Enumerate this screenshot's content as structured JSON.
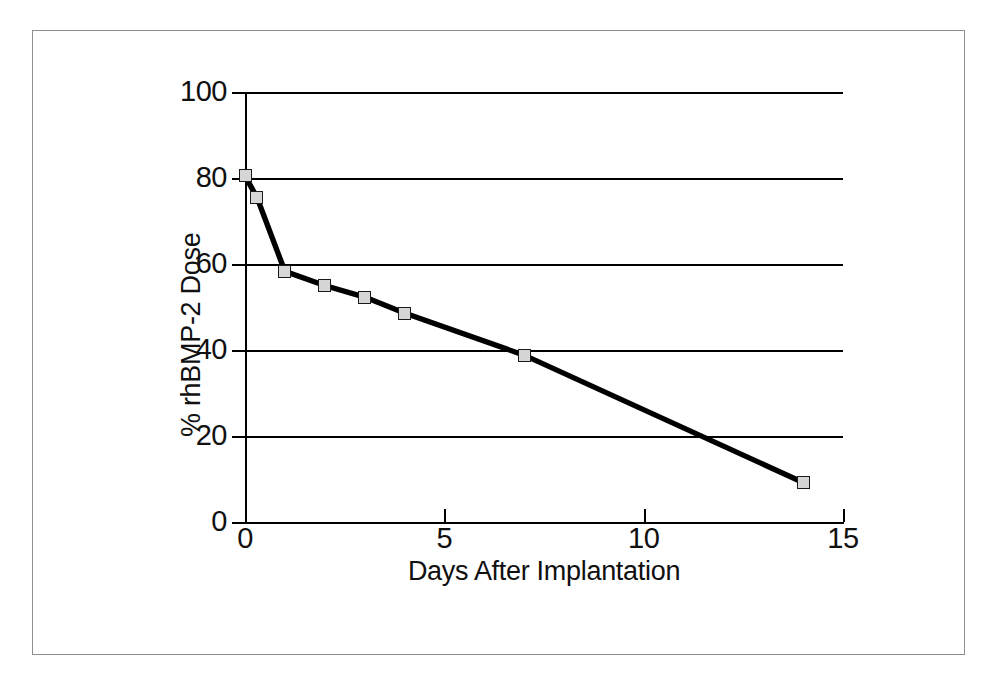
{
  "figure": {
    "background_color": "#ffffff",
    "frame_color": "#8e8e8e",
    "line_color": "#000000",
    "marker_fill": "#d6d6d6",
    "marker_edge": "#1a1a1a"
  },
  "chart_data": {
    "type": "line",
    "title": "",
    "xlabel": "Days After Implantation",
    "ylabel": "% rhBMP-2 Dose",
    "xlim": [
      0,
      15
    ],
    "ylim": [
      0,
      100
    ],
    "xticks": [
      0,
      5,
      10,
      15
    ],
    "xticklabels": [
      "0",
      "5",
      "10",
      "15"
    ],
    "yticks": [
      0,
      20,
      40,
      60,
      80,
      100
    ],
    "yticklabels": [
      "0",
      "20",
      "40",
      "60",
      "80",
      "100"
    ],
    "grid": "horizontal",
    "legend": "none",
    "series": [
      {
        "name": "% rhBMP-2 Dose remaining",
        "marker": "square",
        "x": [
          0,
          0.3,
          1,
          2,
          3,
          4,
          7,
          14
        ],
        "y": [
          80.5,
          75.5,
          58.3,
          55.0,
          52.3,
          48.6,
          38.8,
          9.2
        ]
      }
    ]
  }
}
